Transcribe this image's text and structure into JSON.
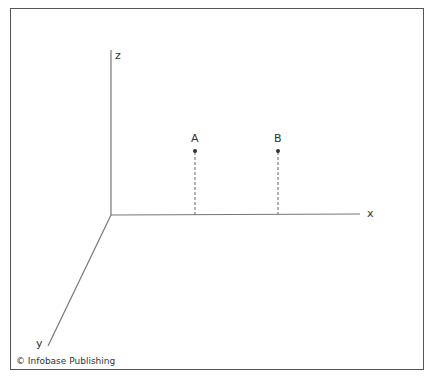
{
  "diagram": {
    "axes": {
      "x_label": "x",
      "y_label": "y",
      "z_label": "z"
    },
    "points": [
      {
        "label": "A"
      },
      {
        "label": "B"
      }
    ],
    "credit": "© Infobase Publishing"
  }
}
